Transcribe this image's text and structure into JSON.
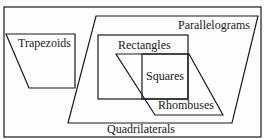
{
  "diagram": {
    "stroke_color": "#1a1a1a",
    "background": "#fdfdfd",
    "sets": {
      "quadrilaterals": {
        "label": "Quadrilaterals"
      },
      "trapezoids": {
        "label": "Trapezoids"
      },
      "parallelograms": {
        "label": "Parallelograms"
      },
      "rectangles": {
        "label": "Rectangles"
      },
      "rhombuses": {
        "label": "Rhombuses"
      },
      "squares": {
        "label": "Squares"
      }
    },
    "relationships": [
      "Trapezoids ⊂ Quadrilaterals",
      "Parallelograms ⊂ Quadrilaterals",
      "Rectangles ⊂ Parallelograms",
      "Rhombuses ⊂ Parallelograms",
      "Squares = Rectangles ∩ Rhombuses"
    ]
  }
}
